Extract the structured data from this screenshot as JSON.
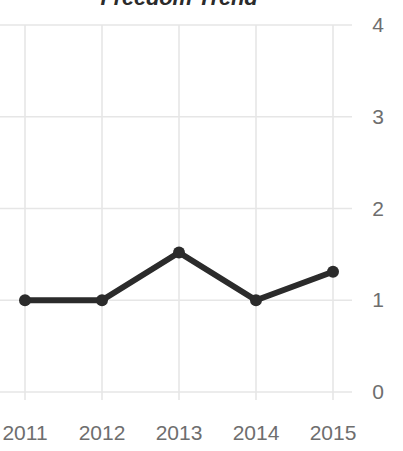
{
  "chart_data": {
    "type": "line",
    "title": "Freedom Trend",
    "xlabel": "",
    "ylabel": "",
    "categories": [
      "2011",
      "2012",
      "2013",
      "2014",
      "2015"
    ],
    "values": [
      1,
      1,
      1.52,
      1,
      1.31
    ],
    "series": [
      {
        "name": "Freedom Trend",
        "values": [
          1,
          1,
          1.52,
          1,
          1.31
        ]
      }
    ],
    "x_tick_labels": [
      "2011",
      "2012",
      "2013",
      "2014",
      "2015"
    ],
    "y_tick_labels": [
      "4",
      "3",
      "2",
      "1",
      "0"
    ],
    "y_ticks": [
      4,
      3,
      2,
      1,
      0
    ],
    "ylim": [
      0,
      4
    ],
    "grid": true,
    "grid_axes": "both",
    "legend": false,
    "legend_position": "none",
    "markers": "circle",
    "y_axis_side": "right",
    "colors": {
      "line": "#2b2b2b",
      "marker": "#2b2b2b",
      "grid": "#e6e6e6",
      "axis_text": "#6e6e6e",
      "title_text": "#2b2b2b",
      "background": "#ffffff"
    }
  }
}
